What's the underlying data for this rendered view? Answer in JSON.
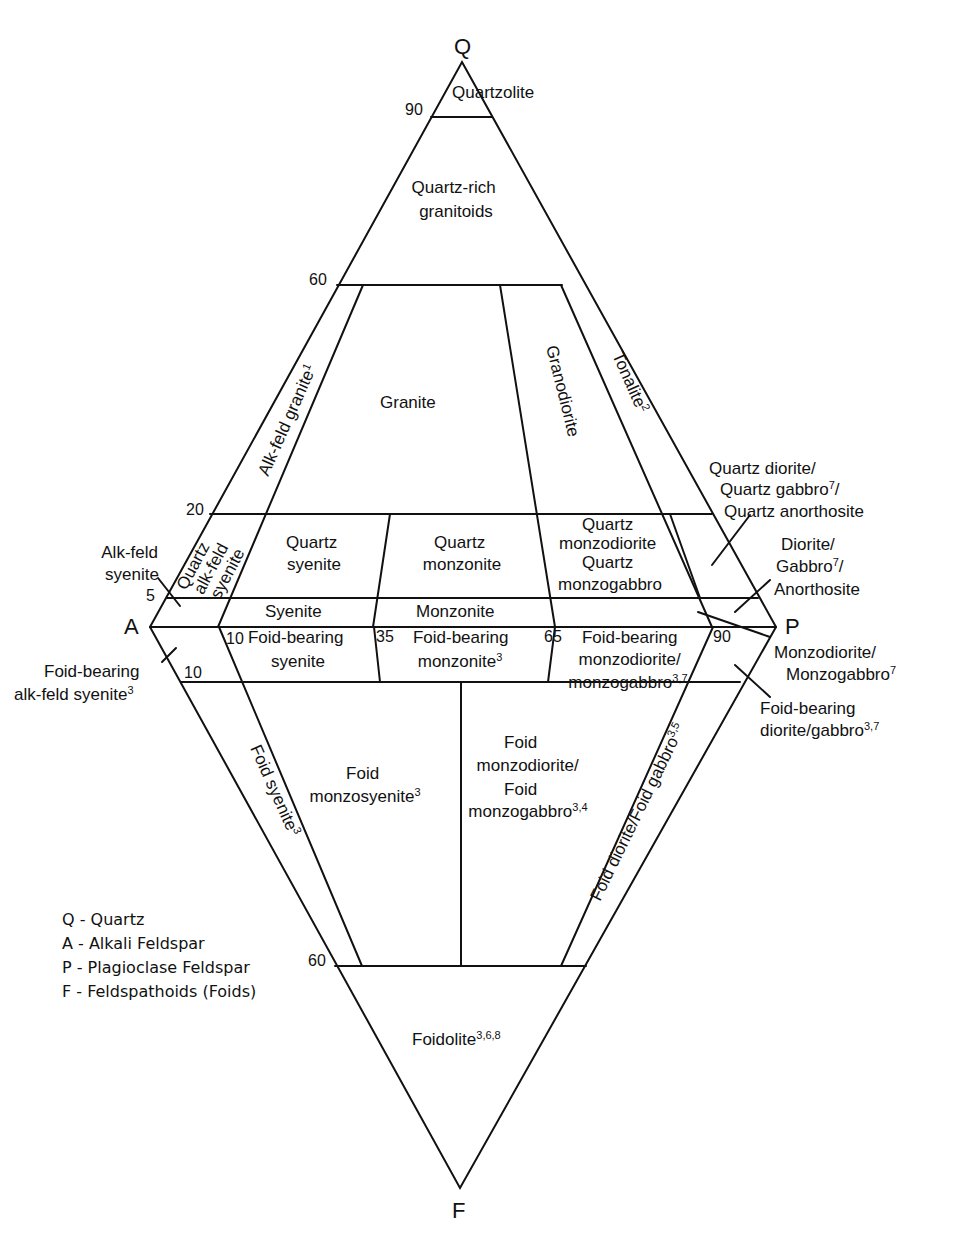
{
  "vertices": {
    "Q": "Q",
    "A": "A",
    "P": "P",
    "F": "F"
  },
  "ticks": {
    "q90": "90",
    "q60": "60",
    "q20": "20",
    "q5": "5",
    "p10": "10",
    "p35": "35",
    "p65": "65",
    "p90": "90",
    "f10": "10",
    "f60": "60"
  },
  "fields": {
    "quartzolite": "Quartzolite",
    "quartz_rich_1": "Quartz-rich",
    "quartz_rich_2": "granitoids",
    "alk_feld_granite": "Alk-feld granite",
    "alk_feld_granite_sup": "1",
    "granite": "Granite",
    "granodiorite": "Granodiorite",
    "tonalite": "Tonalite",
    "tonalite_sup": "2",
    "quartz_alk_syenite_1": "Quartz",
    "quartz_alk_syenite_2": "alk-feld",
    "quartz_alk_syenite_3": "syenite",
    "quartz_syenite_1": "Quartz",
    "quartz_syenite_2": "syenite",
    "quartz_monzonite_1": "Quartz",
    "quartz_monzonite_2": "monzonite",
    "quartz_monzodiorite_1": "Quartz",
    "quartz_monzodiorite_2": "monzodiorite",
    "quartz_monzodiorite_3": "Quartz",
    "quartz_monzodiorite_4": "monzogabbro",
    "syenite": "Syenite",
    "monzonite": "Monzonite",
    "foid_bearing_syenite_1": "Foid-bearing",
    "foid_bearing_syenite_2": "syenite",
    "foid_bearing_monzonite_1": "Foid-bearing",
    "foid_bearing_monzonite_2": "monzonite",
    "foid_bearing_monzonite_sup": "3",
    "foid_bearing_monzodiorite_1": "Foid-bearing",
    "foid_bearing_monzodiorite_2": "monzodiorite/",
    "foid_bearing_monzodiorite_3": "monzogabbro",
    "foid_bearing_monzodiorite_sup": "3,7",
    "foid_syenite": "Foid syenite",
    "foid_syenite_sup": "3",
    "foid_monzosyenite_1": "Foid",
    "foid_monzosyenite_2": "monzosyenite",
    "foid_monzosyenite_sup": "3",
    "foid_monzodiorite_1": "Foid",
    "foid_monzodiorite_2": "monzodiorite/",
    "foid_monzodiorite_3": "Foid",
    "foid_monzodiorite_4": "monzogabbro",
    "foid_monzodiorite_sup": "3,4",
    "foid_diorite": "Foid diorite/Foid gabbro",
    "foid_diorite_sup": "3,5",
    "foidolite": "Foidolite",
    "foidolite_sup": "3,6,8"
  },
  "callouts": {
    "alk_feld_syenite_1": "Alk-feld",
    "alk_feld_syenite_2": "syenite",
    "foid_bearing_alk_1": "Foid-bearing",
    "foid_bearing_alk_2": "alk-feld syenite",
    "foid_bearing_alk_sup": "3",
    "quartz_diorite_1": "Quartz diorite/",
    "quartz_diorite_2": "Quartz gabbro",
    "quartz_diorite_2_sup": "7",
    "quartz_diorite_2_end": "/",
    "quartz_diorite_3": "Quartz anorthosite",
    "diorite_1": "Diorite/",
    "diorite_2": "Gabbro",
    "diorite_2_sup": "7",
    "diorite_2_end": "/",
    "diorite_3": "Anorthosite",
    "monzodiorite_1": "Monzodiorite/",
    "monzodiorite_2": "Monzogabbro",
    "monzodiorite_2_sup": "7",
    "foid_bearing_diorite_1": "Foid-bearing",
    "foid_bearing_diorite_2": "diorite/gabbro",
    "foid_bearing_diorite_sup": "3,7"
  },
  "legend": [
    "Q - Quartz",
    "A - Alkali Feldspar",
    "P - Plagioclase Feldspar",
    "F - Feldspathoids (Foids)"
  ]
}
